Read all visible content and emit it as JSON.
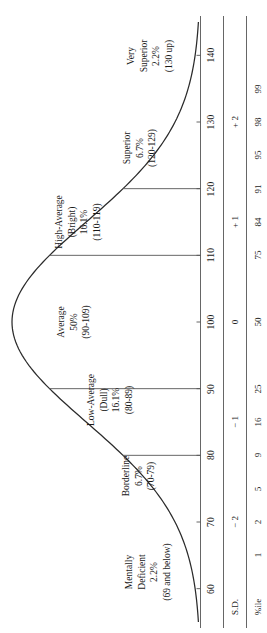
{
  "chart_data": {
    "type": "line",
    "orientation": "rotated-90-ccw",
    "xlabel": "IQ",
    "ylabel": "Frequency",
    "xlim": [
      55,
      145
    ],
    "grid": false,
    "legend": "none",
    "scales": [
      {
        "name": "IQ",
        "caption": "",
        "ticks": [
          {
            "label": "60",
            "iq": 60
          },
          {
            "label": "70",
            "iq": 70
          },
          {
            "label": "80",
            "iq": 80
          },
          {
            "label": "90",
            "iq": 90
          },
          {
            "label": "100",
            "iq": 100
          },
          {
            "label": "110",
            "iq": 110
          },
          {
            "label": "120",
            "iq": 120
          },
          {
            "label": "130",
            "iq": 130
          },
          {
            "label": "140",
            "iq": 140
          }
        ]
      },
      {
        "name": "S.D.",
        "caption": "S.D.",
        "ticks": [
          {
            "label": "− 2",
            "iq": 70
          },
          {
            "label": "− 1",
            "iq": 85
          },
          {
            "label": "0",
            "iq": 100
          },
          {
            "label": "+ 1",
            "iq": 115
          },
          {
            "label": "+ 2",
            "iq": 130
          }
        ]
      },
      {
        "name": "%ile",
        "caption": "%ile",
        "ticks": [
          {
            "label": "1",
            "iq": 65
          },
          {
            "label": "2",
            "iq": 70
          },
          {
            "label": "5",
            "iq": 75
          },
          {
            "label": "9",
            "iq": 80
          },
          {
            "label": "16",
            "iq": 85
          },
          {
            "label": "25",
            "iq": 90
          },
          {
            "label": "50",
            "iq": 100
          },
          {
            "label": "75",
            "iq": 110
          },
          {
            "label": "84",
            "iq": 115
          },
          {
            "label": "91",
            "iq": 120
          },
          {
            "label": "95",
            "iq": 125
          },
          {
            "label": "98",
            "iq": 130
          },
          {
            "label": "99",
            "iq": 135
          }
        ]
      }
    ],
    "categories": [
      {
        "id": "mentally-deficient",
        "lines": [
          "Mentally",
          "Deficient",
          "2.2%",
          "(69 and below)"
        ],
        "name": "Mentally Deficient",
        "percent": "2.2%",
        "range": "(69 and below)",
        "iq_low": null,
        "iq_high": 69
      },
      {
        "id": "borderline",
        "lines": [
          "Borderline",
          "6.7%",
          "(70-79)"
        ],
        "name": "Borderline",
        "percent": "6.7%",
        "range": "(70-79)",
        "iq_low": 70,
        "iq_high": 79
      },
      {
        "id": "low-average",
        "lines": [
          "Low-Average",
          "(Dull)",
          "16.1%",
          "(80-89)"
        ],
        "name": "Low-Average (Dull)",
        "percent": "16.1%",
        "range": "(80-89)",
        "iq_low": 80,
        "iq_high": 89
      },
      {
        "id": "average",
        "lines": [
          "Average",
          "50%",
          "(90-109)"
        ],
        "name": "Average",
        "percent": "50%",
        "range": "(90-109)",
        "iq_low": 90,
        "iq_high": 109
      },
      {
        "id": "high-average",
        "lines": [
          "High-Average",
          "(Bright)",
          "16.1%",
          "(110-119)"
        ],
        "name": "High-Average (Bright)",
        "percent": "16.1%",
        "range": "(110-119)",
        "iq_low": 110,
        "iq_high": 119
      },
      {
        "id": "superior",
        "lines": [
          "Superior",
          "6.7%",
          "(120-129)"
        ],
        "name": "Superior",
        "percent": "6.7%",
        "range": "(120-129)",
        "iq_low": 120,
        "iq_high": 129
      },
      {
        "id": "very-superior",
        "lines": [
          "Very",
          "Superior",
          "2.2%",
          "(130 up)"
        ],
        "name": "Very Superior",
        "percent": "2.2%",
        "range": "(130 up)",
        "iq_low": 130,
        "iq_high": null
      }
    ],
    "divider_iqs": [
      80,
      90,
      110,
      120
    ],
    "colors": {
      "curve": "#2b2b2b",
      "axis": "#555555",
      "text": "#1a1a1a",
      "background": "#ffffff"
    }
  }
}
